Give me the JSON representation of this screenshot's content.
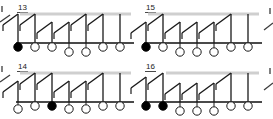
{
  "figure": {
    "type": "diagram",
    "background_color": "#ffffff",
    "stroke_color": "#1a1a1a",
    "rail_color": "#cfcfcf",
    "base_color": "#4a4a4a",
    "fill_color": "#000000",
    "open_color": "#ffffff",
    "width": 273,
    "height": 119
  },
  "panels": [
    {
      "label": "13",
      "label_x": 18,
      "label_y": 10,
      "origin_x": 14,
      "origin_y": 2,
      "rail": {
        "x1": 6,
        "y1": 12,
        "x2": 117,
        "y2": 12
      },
      "base": {
        "x1": 2,
        "y1": 41,
        "x2": 120,
        "y2": 41
      },
      "hooks": [
        {
          "x": 4,
          "y1": 12,
          "y2": 41,
          "diag_dx": 15,
          "diag_dy": -11
        },
        {
          "x": 21,
          "y1": 12,
          "y2": 41,
          "diag_dx": 15,
          "diag_dy": -11
        },
        {
          "x": 38,
          "y1": 20,
          "y2": 41,
          "diag_dx": 15,
          "diag_dy": -11
        },
        {
          "x": 55,
          "y1": 20,
          "y2": 41,
          "diag_dx": 15,
          "diag_dy": -11
        },
        {
          "x": 72,
          "y1": 12,
          "y2": 41,
          "diag_dx": 15,
          "diag_dy": -11
        },
        {
          "x": 89,
          "y1": 12,
          "y2": 41,
          "diag_dx": 15,
          "diag_dy": -11
        },
        {
          "x": 106,
          "y1": 12,
          "y2": 41,
          "diag_dx": 0,
          "diag_dy": 0
        }
      ],
      "circles": [
        {
          "cx": 4,
          "cy": 45,
          "r": 4.2,
          "filled": true,
          "level": 0
        },
        {
          "cx": 21,
          "cy": 45,
          "r": 4.2,
          "filled": false,
          "level": 0
        },
        {
          "cx": 38,
          "cy": 45,
          "r": 4.2,
          "filled": false,
          "level": 0
        },
        {
          "cx": 55,
          "cy": 50,
          "r": 4.2,
          "filled": false,
          "level": 1
        },
        {
          "cx": 72,
          "cy": 50,
          "r": 4.2,
          "filled": false,
          "level": 1
        },
        {
          "cx": 89,
          "cy": 45,
          "r": 4.2,
          "filled": false,
          "level": 0
        },
        {
          "cx": 106,
          "cy": 45,
          "r": 4.2,
          "filled": false,
          "level": 0
        }
      ],
      "filled_count": 1,
      "circle_count": 7
    },
    {
      "label": "15",
      "label_x": 146,
      "label_y": 10,
      "origin_x": 142,
      "origin_y": 2,
      "rail": {
        "x1": 6,
        "y1": 12,
        "x2": 117,
        "y2": 12
      },
      "base": {
        "x1": 2,
        "y1": 41,
        "x2": 120,
        "y2": 41
      },
      "hooks": [
        {
          "x": 4,
          "y1": 20,
          "y2": 41,
          "diag_dx": 15,
          "diag_dy": -11
        },
        {
          "x": 21,
          "y1": 12,
          "y2": 41,
          "diag_dx": 15,
          "diag_dy": -11
        },
        {
          "x": 38,
          "y1": 20,
          "y2": 41,
          "diag_dx": 15,
          "diag_dy": -11
        },
        {
          "x": 55,
          "y1": 20,
          "y2": 41,
          "diag_dx": 15,
          "diag_dy": -11
        },
        {
          "x": 72,
          "y1": 20,
          "y2": 41,
          "diag_dx": 15,
          "diag_dy": -11
        },
        {
          "x": 89,
          "y1": 12,
          "y2": 41,
          "diag_dx": 15,
          "diag_dy": -11
        },
        {
          "x": 106,
          "y1": 12,
          "y2": 41,
          "diag_dx": 0,
          "diag_dy": 0
        }
      ],
      "circles": [
        {
          "cx": 4,
          "cy": 45,
          "r": 4.2,
          "filled": true,
          "level": 0
        },
        {
          "cx": 21,
          "cy": 45,
          "r": 4.2,
          "filled": false,
          "level": 0
        },
        {
          "cx": 38,
          "cy": 50,
          "r": 4.2,
          "filled": false,
          "level": 1
        },
        {
          "cx": 55,
          "cy": 50,
          "r": 4.2,
          "filled": false,
          "level": 1
        },
        {
          "cx": 72,
          "cy": 50,
          "r": 4.2,
          "filled": false,
          "level": 1
        },
        {
          "cx": 89,
          "cy": 45,
          "r": 4.2,
          "filled": false,
          "level": 0
        },
        {
          "cx": 106,
          "cy": 45,
          "r": 4.2,
          "filled": false,
          "level": 0
        }
      ],
      "filled_count": 1,
      "circle_count": 7
    },
    {
      "label": "14",
      "label_x": 18,
      "label_y": 69,
      "origin_x": 14,
      "origin_y": 61,
      "rail": {
        "x1": 6,
        "y1": 12,
        "x2": 117,
        "y2": 12
      },
      "base": {
        "x1": 2,
        "y1": 41,
        "x2": 120,
        "y2": 41
      },
      "hooks": [
        {
          "x": 4,
          "y1": 20,
          "y2": 41,
          "diag_dx": 15,
          "diag_dy": -11
        },
        {
          "x": 21,
          "y1": 12,
          "y2": 41,
          "diag_dx": 15,
          "diag_dy": -11
        },
        {
          "x": 38,
          "y1": 12,
          "y2": 41,
          "diag_dx": 15,
          "diag_dy": -11
        },
        {
          "x": 55,
          "y1": 20,
          "y2": 41,
          "diag_dx": 15,
          "diag_dy": -11
        },
        {
          "x": 72,
          "y1": 20,
          "y2": 41,
          "diag_dx": 15,
          "diag_dy": -11
        },
        {
          "x": 89,
          "y1": 12,
          "y2": 41,
          "diag_dx": 15,
          "diag_dy": -11
        },
        {
          "x": 106,
          "y1": 12,
          "y2": 41,
          "diag_dx": 0,
          "diag_dy": 0
        }
      ],
      "circles": [
        {
          "cx": 4,
          "cy": 48,
          "r": 4.2,
          "filled": false,
          "level": 1
        },
        {
          "cx": 21,
          "cy": 45,
          "r": 4.2,
          "filled": false,
          "level": 0
        },
        {
          "cx": 38,
          "cy": 45,
          "r": 4.2,
          "filled": true,
          "level": 0
        },
        {
          "cx": 55,
          "cy": 48,
          "r": 4.2,
          "filled": false,
          "level": 1
        },
        {
          "cx": 72,
          "cy": 48,
          "r": 4.2,
          "filled": false,
          "level": 1
        },
        {
          "cx": 89,
          "cy": 45,
          "r": 4.2,
          "filled": false,
          "level": 0
        },
        {
          "cx": 106,
          "cy": 45,
          "r": 4.2,
          "filled": false,
          "level": 0
        }
      ],
      "filled_count": 1,
      "circle_count": 7
    },
    {
      "label": "16",
      "label_x": 146,
      "label_y": 69,
      "origin_x": 142,
      "origin_y": 61,
      "rail": {
        "x1": 24,
        "y1": 12,
        "x2": 117,
        "y2": 12
      },
      "base": {
        "x1": 2,
        "y1": 41,
        "x2": 120,
        "y2": 41
      },
      "hooks": [
        {
          "x": 4,
          "y1": 16,
          "y2": 41,
          "diag_dx": 15,
          "diag_dy": -11
        },
        {
          "x": 21,
          "y1": 12,
          "y2": 41,
          "diag_dx": 15,
          "diag_dy": -11
        },
        {
          "x": 38,
          "y1": 22,
          "y2": 41,
          "diag_dx": 15,
          "diag_dy": -11
        },
        {
          "x": 55,
          "y1": 22,
          "y2": 41,
          "diag_dx": 15,
          "diag_dy": -11
        },
        {
          "x": 72,
          "y1": 22,
          "y2": 41,
          "diag_dx": 15,
          "diag_dy": -11
        },
        {
          "x": 89,
          "y1": 12,
          "y2": 41,
          "diag_dx": 15,
          "diag_dy": -11
        },
        {
          "x": 106,
          "y1": 12,
          "y2": 41,
          "diag_dx": 0,
          "diag_dy": 0
        }
      ],
      "circles": [
        {
          "cx": 4,
          "cy": 45,
          "r": 4.2,
          "filled": true,
          "level": 0
        },
        {
          "cx": 21,
          "cy": 45,
          "r": 4.2,
          "filled": true,
          "level": 0
        },
        {
          "cx": 38,
          "cy": 50,
          "r": 4.2,
          "filled": false,
          "level": 1
        },
        {
          "cx": 55,
          "cy": 50,
          "r": 4.2,
          "filled": false,
          "level": 1
        },
        {
          "cx": 72,
          "cy": 50,
          "r": 4.2,
          "filled": false,
          "level": 1
        },
        {
          "cx": 89,
          "cy": 45,
          "r": 4.2,
          "filled": false,
          "level": 0
        },
        {
          "cx": 106,
          "cy": 45,
          "r": 4.2,
          "filled": false,
          "level": 0
        }
      ],
      "filled_count": 2,
      "circle_count": 7
    }
  ],
  "edge_fragments": [
    {
      "name": "left-top-fragment",
      "x1": 0,
      "y1": 22,
      "x2": 10,
      "y2": 15
    },
    {
      "name": "left-bottom-fragment",
      "x1": 0,
      "y1": 82,
      "x2": 10,
      "y2": 75
    },
    {
      "name": "right-top-fragment",
      "x1": 264,
      "y1": 30,
      "x2": 273,
      "y2": 23
    },
    {
      "name": "right-bottom-fragment",
      "x1": 264,
      "y1": 90,
      "x2": 273,
      "y2": 83
    },
    {
      "name": "left-top-tick",
      "x1": 2,
      "y1": 6,
      "x2": 2,
      "y2": 12
    },
    {
      "name": "left-bottom-tick",
      "x1": 2,
      "y1": 66,
      "x2": 2,
      "y2": 72
    },
    {
      "name": "right-top-tick",
      "x1": 270,
      "y1": 8,
      "x2": 270,
      "y2": 14
    },
    {
      "name": "right-bottom-tick",
      "x1": 270,
      "y1": 68,
      "x2": 270,
      "y2": 74
    }
  ]
}
